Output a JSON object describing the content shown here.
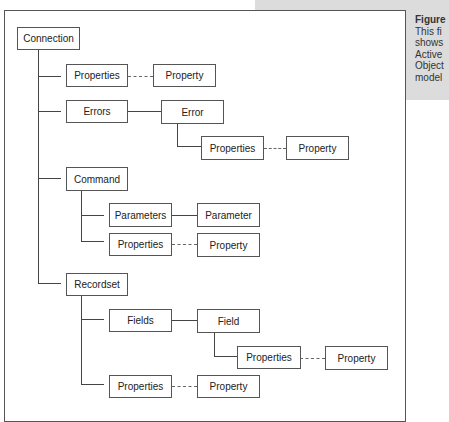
{
  "caption": {
    "title": "Figure",
    "lines": [
      "This fi",
      "shows",
      "Active",
      "Object",
      "model"
    ]
  },
  "nodes": {
    "connection": "Connection",
    "conn_properties": "Properties",
    "conn_property": "Property",
    "errors": "Errors",
    "error": "Error",
    "error_properties": "Properties",
    "error_property": "Property",
    "command": "Command",
    "parameters": "Parameters",
    "parameter": "Parameter",
    "cmd_properties": "Properties",
    "cmd_property": "Property",
    "recordset": "Recordset",
    "fields": "Fields",
    "field": "Field",
    "field_properties": "Properties",
    "field_property": "Property",
    "rs_properties": "Properties",
    "rs_property": "Property"
  }
}
